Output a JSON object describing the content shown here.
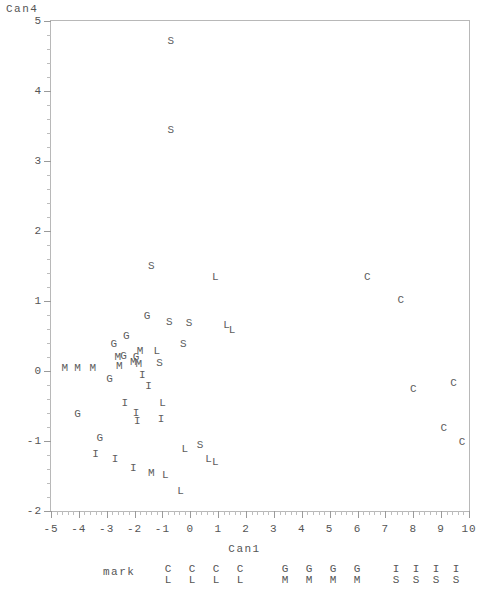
{
  "chart_data": {
    "type": "scatter",
    "title": "",
    "xlabel": "Can1",
    "ylabel": "Can4",
    "xlim": [
      -5,
      10
    ],
    "ylim": [
      -2,
      5
    ],
    "xticks": [
      "-5",
      "-4",
      "-3",
      "-2",
      "-1",
      "0",
      "1",
      "2",
      "3",
      "4",
      "5",
      "6",
      "7",
      "8",
      "9",
      "10"
    ],
    "yticks": [
      "5",
      "4",
      "3",
      "2",
      "1",
      "0",
      "-1",
      "-2"
    ],
    "grid": false,
    "legend_position": "bottom",
    "legend_title": "mark",
    "point_marker": "group-letter",
    "series": [
      {
        "name": "CL",
        "label": "C",
        "points": [
          [
            6.35,
            1.35
          ],
          [
            7.55,
            1.02
          ],
          [
            8.0,
            -0.25
          ],
          [
            9.45,
            -0.17
          ],
          [
            9.1,
            -0.82
          ],
          [
            9.75,
            -1.02
          ]
        ]
      },
      {
        "name": "GM",
        "label": "G",
        "points": [
          [
            -1.55,
            0.78
          ],
          [
            -2.3,
            0.5
          ],
          [
            -2.75,
            0.38
          ],
          [
            -1.95,
            0.2
          ],
          [
            -2.4,
            0.22
          ],
          [
            -2.9,
            -0.12
          ],
          [
            -4.05,
            -0.62
          ],
          [
            -3.25,
            -0.95
          ]
        ]
      },
      {
        "name": "GM",
        "label": "M",
        "points": [
          [
            -4.5,
            0.05
          ],
          [
            -4.05,
            0.05
          ],
          [
            -3.5,
            0.05
          ],
          [
            -2.55,
            0.07
          ],
          [
            -2.6,
            0.2
          ],
          [
            -1.8,
            0.28
          ],
          [
            -1.85,
            0.1
          ],
          [
            -2.05,
            0.13
          ],
          [
            -1.4,
            -1.45
          ]
        ]
      },
      {
        "name": "IS",
        "label": "I",
        "points": [
          [
            -1.72,
            -0.05
          ],
          [
            -1.5,
            -0.22
          ],
          [
            -2.35,
            -0.45
          ],
          [
            -1.95,
            -0.6
          ],
          [
            -1.9,
            -0.72
          ],
          [
            -3.4,
            -1.18
          ],
          [
            -2.7,
            -1.25
          ],
          [
            -2.05,
            -1.38
          ],
          [
            -1.05,
            -0.68
          ]
        ]
      },
      {
        "name": "IS",
        "label": "S",
        "points": [
          [
            -0.7,
            4.72
          ],
          [
            -0.7,
            3.45
          ],
          [
            -1.4,
            1.5
          ],
          [
            -0.75,
            0.7
          ],
          [
            -0.05,
            0.68
          ],
          [
            -0.25,
            0.38
          ],
          [
            -1.1,
            0.12
          ],
          [
            0.35,
            -1.05
          ]
        ]
      },
      {
        "name": "CL",
        "label": "L",
        "points": [
          [
            0.9,
            1.35
          ],
          [
            1.3,
            0.66
          ],
          [
            1.5,
            0.58
          ],
          [
            -1.2,
            0.28
          ],
          [
            -1.0,
            -0.45
          ],
          [
            -0.2,
            -1.12
          ],
          [
            0.65,
            -1.25
          ],
          [
            0.9,
            -1.3
          ],
          [
            -0.9,
            -1.48
          ],
          [
            -0.35,
            -1.72
          ]
        ]
      }
    ]
  },
  "legend": {
    "title": "mark",
    "entries": [
      {
        "top": "C",
        "bottom": "L"
      },
      {
        "top": "C",
        "bottom": "L"
      },
      {
        "top": "C",
        "bottom": "L"
      },
      {
        "top": "C",
        "bottom": "L"
      },
      {
        "top": "G",
        "bottom": "M"
      },
      {
        "top": "G",
        "bottom": "M"
      },
      {
        "top": "G",
        "bottom": "M"
      },
      {
        "top": "G",
        "bottom": "M"
      },
      {
        "top": "I",
        "bottom": "S"
      },
      {
        "top": "I",
        "bottom": "S"
      },
      {
        "top": "I",
        "bottom": "S"
      },
      {
        "top": "I",
        "bottom": "S"
      }
    ],
    "entry_x": [
      168,
      192,
      216,
      240,
      285,
      309,
      333,
      357,
      396,
      416,
      436,
      456
    ]
  },
  "axes": {
    "x_title": "Can1",
    "y_title": "Can4"
  }
}
